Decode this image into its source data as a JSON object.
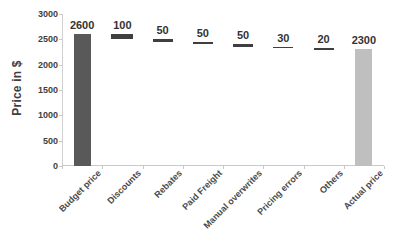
{
  "chart_data": {
    "type": "bar",
    "chart_variant": "waterfall",
    "title": "",
    "xlabel": "",
    "ylabel": "Price in $",
    "ylim": [
      0,
      3000
    ],
    "ytick_step": 500,
    "yticks": [
      "3000",
      "2500",
      "2000",
      "1500",
      "1000",
      "500",
      "0"
    ],
    "ytick_values": [
      3000,
      2500,
      2000,
      1500,
      1000,
      500,
      0
    ],
    "grid": false,
    "legend": null,
    "categories": [
      "Budget price",
      "Discounts",
      "Rebates",
      "Paid Freight",
      "Manual overwrites",
      "Pricing errors",
      "Others",
      "Actual price"
    ],
    "values": [
      2600,
      100,
      50,
      50,
      50,
      30,
      20,
      2300
    ],
    "data_labels": [
      "2600",
      "100",
      "50",
      "50",
      "50",
      "30",
      "20",
      "2300"
    ],
    "bar_kinds": [
      "total",
      "delta",
      "delta",
      "delta",
      "delta",
      "delta",
      "delta",
      "total"
    ],
    "bar_bottoms": [
      0,
      2500,
      2450,
      2400,
      2350,
      2320,
      2300,
      0
    ],
    "bar_tops": [
      2600,
      2600,
      2500,
      2450,
      2400,
      2350,
      2320,
      2300
    ],
    "colors": {
      "total_first": "#595959",
      "total_last": "#bfbfbf",
      "delta": "#3f3f3f",
      "axis": "#c9c9c9",
      "text": "#3f3f3f"
    }
  }
}
